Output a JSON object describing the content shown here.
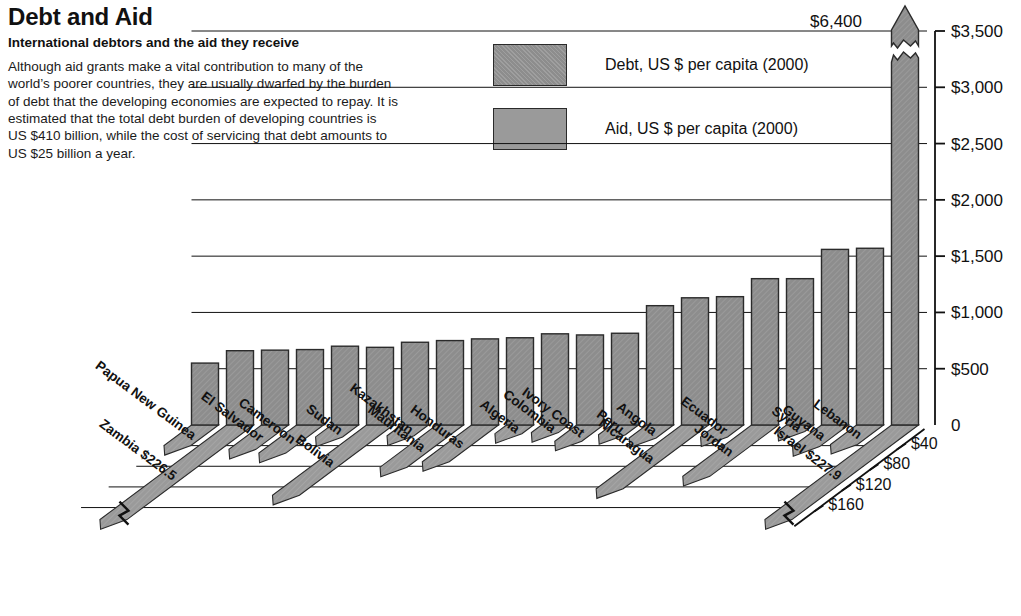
{
  "header": {
    "title": "Debt and Aid",
    "subtitle": "International debtors and the aid they receive",
    "body": "Although aid grants make a vital contribution to many of the world’s poorer countries, they are usually dwarfed by the burden of debt that the developing economies are expected to repay. It is estimated that the total debt burden of developing countries is US $410 billion, while the cost of servicing that debt amounts to US $25 billion a year."
  },
  "legend": {
    "items": [
      {
        "label": "Debt, US $ per capita (2000)",
        "color": "#8d8d8d",
        "key": "debt"
      },
      {
        "label": "Aid, US $ per capita (2000)",
        "color": "#9a9a9a",
        "key": "aid"
      }
    ]
  },
  "annotations": {
    "israel_debt_peak": "$6,400",
    "israel_aid_peak": "Israel $227.9",
    "zambia_aid_peak": "Zambia $226.5"
  },
  "chart_data": {
    "type": "bar",
    "title": "Debt and Aid",
    "subtitle": "International debtors and the aid they receive",
    "xlabel": "",
    "ylabel": "US $ per capita (2000)",
    "ylim": [
      0,
      3500
    ],
    "grid": true,
    "legend_position": "top-center",
    "debt_axis": {
      "side": "right",
      "ticks": [
        0,
        500,
        1000,
        1500,
        2000,
        2500,
        3000,
        3500
      ],
      "tick_labels": [
        "0",
        "$500",
        "$1,000",
        "$1,500",
        "$2,000",
        "$2,500",
        "$3,000",
        "$3,500"
      ],
      "broken_top": true,
      "broken_value_label": "$6,400"
    },
    "aid_axis": {
      "side": "bottom-left-diagonal",
      "ticks": [
        40,
        80,
        120,
        160
      ],
      "tick_labels": [
        "$40",
        "$80",
        "$120",
        "$160"
      ],
      "broken": true,
      "broken_value_labels": [
        "Zambia $226.5",
        "Israel $227.9"
      ]
    },
    "categories": [
      "Papua New Guinea",
      "Zambia",
      "El Salvador",
      "Cameroon",
      "Sudan",
      "Bolivia",
      "Kazakhstan",
      "Mauritania",
      "Honduras",
      "Algeria",
      "Colombia",
      "Ivory Coast",
      "Peru",
      "Angola",
      "Nicaragua",
      "Ecuador",
      "Jordan",
      "Syria",
      "Guyana",
      "Lebanon",
      "Israel"
    ],
    "series": [
      {
        "name": "Debt, US $ per capita (2000)",
        "unit": "US $ per capita",
        "values": [
          550,
          660,
          665,
          670,
          700,
          690,
          735,
          750,
          765,
          775,
          810,
          800,
          815,
          1060,
          1130,
          1140,
          1300,
          1300,
          1560,
          1570,
          6400
        ]
      },
      {
        "name": "Aid, US $ per capita (2000)",
        "unit": "US $ per capita",
        "values": [
          38,
          226.5,
          45,
          52,
          22,
          130,
          20,
          78,
          68,
          16,
          14,
          30,
          18,
          24,
          118,
          22,
          95,
          12,
          40,
          36,
          227.9
        ]
      }
    ]
  }
}
